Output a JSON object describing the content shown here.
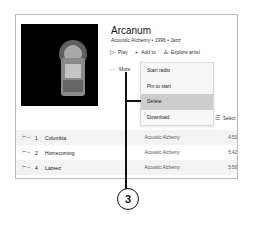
{
  "album": {
    "title": "Arcanum",
    "subtitle": "Acoustic Alchemy • 1996 • Jazz",
    "cover_alt": "album-cover-art"
  },
  "actions": {
    "play": {
      "icon": "play-icon",
      "label": "Play"
    },
    "add_to": {
      "icon": "plus-icon",
      "label": "Add to"
    },
    "explore_artist": {
      "icon": "person-icon",
      "label": "Explore artist"
    },
    "more": {
      "icon": "ellipsis-icon",
      "label": "More"
    }
  },
  "context_menu": {
    "items": [
      {
        "label": "Start radio",
        "active": false
      },
      {
        "label": "Pin to start",
        "active": false
      },
      {
        "label": "Delete",
        "active": true
      },
      {
        "label": "Download",
        "active": false
      }
    ]
  },
  "select": {
    "icon": "select-list-icon",
    "label": "Select"
  },
  "tracks": [
    {
      "number": "1",
      "name": "Columbia",
      "artist": "Acoustic Alchemy",
      "duration": "4:50"
    },
    {
      "number": "2",
      "name": "Homecoming",
      "artist": "Acoustic Alchemy",
      "duration": "5:42"
    },
    {
      "number": "4",
      "name": "Lazeez",
      "artist": "Acoustic Alchemy",
      "duration": "5:50"
    }
  ],
  "callout": {
    "number": "3"
  },
  "colors": {
    "menu_bg": "#f7f7f7",
    "menu_active": "#cdcdcd",
    "row_alt": "#f3f3f3",
    "callout": "#111111"
  }
}
